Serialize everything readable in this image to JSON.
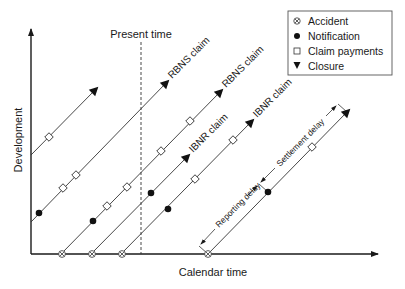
{
  "axes": {
    "x_label": "Calendar time",
    "y_label": "Development"
  },
  "present_time": {
    "label": "Present time",
    "x": 141
  },
  "legend": {
    "items": [
      {
        "symbol": "accident",
        "glyph": "circle-x",
        "label": "Accident"
      },
      {
        "symbol": "notification",
        "glyph": "filled-circle",
        "label": "Notification"
      },
      {
        "symbol": "payment",
        "glyph": "open-square",
        "label": "Claim payments"
      },
      {
        "symbol": "closure",
        "glyph": "filled-triangle",
        "label": "Closure"
      }
    ]
  },
  "claims": [
    {
      "label": "",
      "start": [
        31,
        155
      ],
      "end": [
        95,
        90
      ],
      "accident": null,
      "notification": null,
      "payments": [
        [
          49,
          137
        ]
      ]
    },
    {
      "label": "RBNS claim",
      "start": [
        31,
        222
      ],
      "end": [
        166,
        83
      ],
      "accident": null,
      "notification": [
        39,
        213
      ],
      "payments": [
        [
          63,
          188
        ],
        [
          76,
          175
        ]
      ]
    },
    {
      "label": "RBNS claim",
      "start": [
        62,
        253
      ],
      "end": [
        220,
        92
      ],
      "accident": [
        62,
        253
      ],
      "notification": [
        93,
        221
      ],
      "payments": [
        [
          107,
          206
        ],
        [
          127,
          187
        ],
        [
          161,
          151
        ],
        [
          190,
          121
        ]
      ]
    },
    {
      "label": "IBNR claim",
      "start": [
        92,
        253
      ],
      "end": [
        187,
        157
      ],
      "accident": [
        92,
        253
      ],
      "notification": [
        151,
        193
      ],
      "payments": []
    },
    {
      "label": "IBNR claim",
      "start": [
        122,
        253
      ],
      "end": [
        251,
        122
      ],
      "accident": [
        122,
        253
      ],
      "notification": [
        168,
        209
      ],
      "payments": [
        [
          195,
          179
        ],
        [
          233,
          140
        ]
      ]
    },
    {
      "label": "",
      "start": [
        208,
        254
      ],
      "end": [
        347,
        112
      ],
      "accident": [
        208,
        254
      ],
      "notification": [
        268,
        192
      ],
      "payments": [
        [
          312,
          147
        ]
      ]
    }
  ],
  "annotations": {
    "reporting_delay": "Reporting delay",
    "settlement_delay": "Settlement delay"
  }
}
